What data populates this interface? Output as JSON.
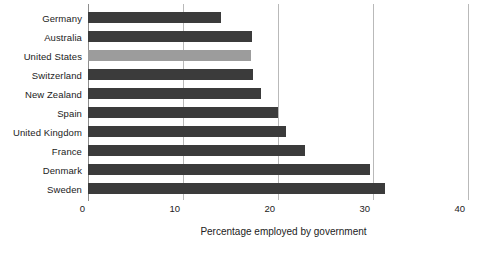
{
  "chart_data": {
    "type": "bar",
    "orientation": "horizontal",
    "title": "",
    "xlabel": "Percentage employed by government",
    "ylabel": "",
    "xlim": [
      0,
      40
    ],
    "xticks": [
      0,
      10,
      20,
      30,
      40
    ],
    "grid": true,
    "legend": "none",
    "categories": [
      "Germany",
      "Australia",
      "United States",
      "Switzerland",
      "New Zealand",
      "Spain",
      "United Kingdom",
      "France",
      "Denmark",
      "Sweden"
    ],
    "values": [
      14.0,
      17.3,
      17.2,
      17.4,
      18.2,
      20.0,
      20.8,
      22.8,
      29.7,
      31.3
    ],
    "highlight_category": "United States",
    "colors": {
      "bar": "#3b3b3b",
      "bar_highlight": "#9c9c9c",
      "gridline": "#b9b9b9",
      "axis": "#8d8d8d",
      "text": "#222222",
      "background": "#ffffff"
    }
  }
}
